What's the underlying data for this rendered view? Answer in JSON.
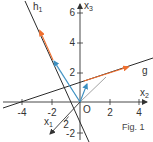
{
  "figure": {
    "caption": "Fig. 1",
    "origin_label": "O",
    "colors": {
      "axis": "#333333",
      "line": "#2b2b2b",
      "direction_vector": "#f07030",
      "position_vector": "#3c8fc0",
      "helper": "#8a8a8a"
    },
    "axes": {
      "x1": {
        "name": "x",
        "sub": "1",
        "ticks": [
          {
            "value": 2,
            "label": "2"
          }
        ]
      },
      "x2": {
        "name": "x",
        "sub": "2",
        "ticks": [
          {
            "value": -4,
            "label": "-4"
          },
          {
            "value": -2,
            "label": "-2"
          },
          {
            "value": 2,
            "label": "2"
          },
          {
            "value": 4,
            "label": "4"
          }
        ]
      },
      "x3": {
        "name": "x",
        "sub": "3",
        "ticks": [
          {
            "value": 6,
            "label": "6"
          },
          {
            "value": 4,
            "label": "4"
          },
          {
            "value": 2,
            "label": "2"
          },
          {
            "value": -2,
            "label": "-2"
          }
        ]
      }
    },
    "lines": {
      "h1": {
        "name": "h",
        "sub": "1"
      },
      "g": {
        "name": "g"
      }
    }
  }
}
